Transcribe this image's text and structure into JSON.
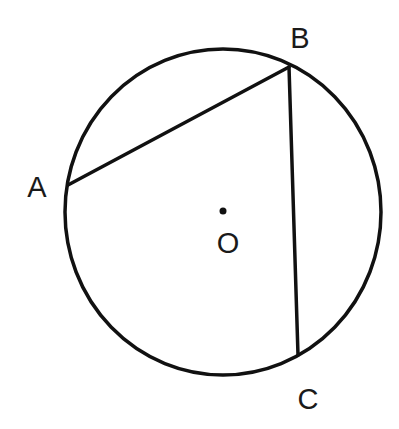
{
  "diagram": {
    "type": "circle-inscribed-angle",
    "colors": {
      "stroke": "#111111",
      "background": "#ffffff",
      "text": "#1a1a1a"
    },
    "circle": {
      "cx": 223,
      "cy": 212,
      "rx": 158,
      "ry": 163,
      "stroke_width": 3.5
    },
    "center": {
      "label": "O",
      "x": 223,
      "y": 211,
      "label_x": 228,
      "label_y": 253
    },
    "points": [
      {
        "id": "A",
        "label": "A",
        "x": 68,
        "y": 185,
        "label_x": 37,
        "label_y": 197
      },
      {
        "id": "B",
        "label": "B",
        "x": 289,
        "y": 67,
        "label_x": 300,
        "label_y": 48
      },
      {
        "id": "C",
        "label": "C",
        "x": 298,
        "y": 355,
        "label_x": 308,
        "label_y": 409
      }
    ],
    "segments": [
      {
        "from": "A",
        "to": "B"
      },
      {
        "from": "B",
        "to": "C"
      }
    ]
  }
}
